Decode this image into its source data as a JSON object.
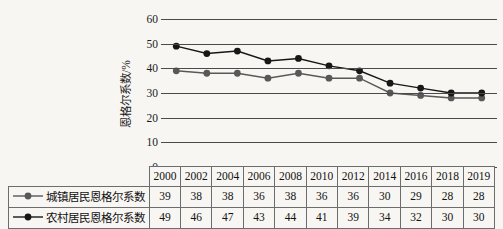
{
  "chart_data": {
    "type": "line",
    "title": "",
    "xlabel": "",
    "ylabel": "恩格尔系数/%",
    "ylim": [
      0,
      60
    ],
    "yticks": [
      0,
      10,
      20,
      30,
      40,
      50,
      60
    ],
    "grid": true,
    "legend_position": "table-row-labels",
    "categories": [
      "2000",
      "2002",
      "2004",
      "2006",
      "2008",
      "2010",
      "2012",
      "2014",
      "2016",
      "2018",
      "2019"
    ],
    "series": [
      {
        "name": "城镇居民恩格尔系数",
        "values": [
          39,
          38,
          38,
          36,
          38,
          36,
          36,
          30,
          29,
          28,
          28
        ],
        "color": "#585858",
        "marker": "circle"
      },
      {
        "name": "农村居民恩格尔系数",
        "values": [
          49,
          46,
          47,
          43,
          44,
          41,
          39,
          34,
          32,
          30,
          30
        ],
        "color": "#171717",
        "marker": "circle"
      }
    ]
  },
  "table": {
    "header_row": [
      "2000",
      "2002",
      "2004",
      "2006",
      "2008",
      "2010",
      "2012",
      "2014",
      "2016",
      "2018",
      "2019"
    ],
    "rows": [
      {
        "label": "城镇居民恩格尔系数",
        "marker_color": "#585858",
        "values": [
          "39",
          "38",
          "38",
          "36",
          "38",
          "36",
          "36",
          "30",
          "29",
          "28",
          "28"
        ]
      },
      {
        "label": "农村居民恩格尔系数",
        "marker_color": "#171717",
        "values": [
          "49",
          "46",
          "47",
          "43",
          "44",
          "41",
          "39",
          "34",
          "32",
          "30",
          "30"
        ]
      }
    ]
  },
  "axis": {
    "y_title": "恩格尔系数/%",
    "y_tick_labels": [
      "60",
      "50",
      "40",
      "30",
      "20",
      "10",
      "0"
    ]
  },
  "colors": {
    "background": "#f8f6f3",
    "gridline": "#4a4a4a",
    "text": "#1b1b1b",
    "table_border": "#6d6d6d",
    "urban_series": "#585858",
    "rural_series": "#171717"
  }
}
